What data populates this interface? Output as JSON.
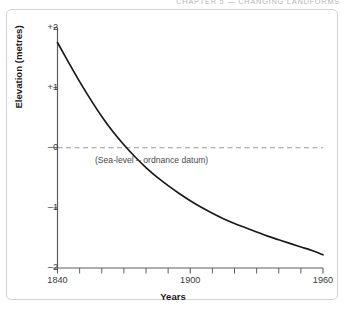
{
  "running_head": {
    "text": "CHAPTER 5  —  CHANGING LANDFORMS"
  },
  "chart_data": {
    "type": "line",
    "title": "",
    "subtitle": "",
    "xlabel": "Years",
    "ylabel": "Elevation (metres)",
    "xlim": [
      1840,
      1960
    ],
    "ylim": [
      -2,
      2
    ],
    "grid": false,
    "legend_position": "none",
    "x_ticks_major": [
      1840,
      1900,
      1960
    ],
    "x_tick_labels": [
      "1840",
      "1900",
      "1960"
    ],
    "x_ticks_minor": [
      1850,
      1860,
      1870,
      1880,
      1890,
      1910,
      1920,
      1930,
      1940,
      1950
    ],
    "y_ticks": [
      2,
      1,
      0,
      -1,
      -2
    ],
    "y_tick_labels": [
      "+2",
      "+1",
      "–0",
      "–1",
      "–2"
    ],
    "annotations": [
      {
        "name": "sea-level-datum-label",
        "text": "(Sea-level – ordnance datum)",
        "x": 1897,
        "y": -0.17
      }
    ],
    "reference_lines": [
      {
        "name": "sea-level-line",
        "orientation": "horizontal",
        "y": 0,
        "style": "dashed",
        "color": "#9a9a9a"
      }
    ],
    "series": [
      {
        "name": "elevation-curve",
        "color": "#1a1a1a",
        "x": [
          1840,
          1845,
          1850,
          1855,
          1860,
          1865,
          1870,
          1875,
          1880,
          1885,
          1890,
          1895,
          1900,
          1905,
          1910,
          1915,
          1920,
          1925,
          1930,
          1935,
          1940,
          1945,
          1950,
          1955,
          1960
        ],
        "values": [
          1.75,
          1.42,
          1.1,
          0.8,
          0.52,
          0.27,
          0.05,
          -0.15,
          -0.33,
          -0.49,
          -0.63,
          -0.76,
          -0.88,
          -0.99,
          -1.09,
          -1.18,
          -1.26,
          -1.33,
          -1.4,
          -1.47,
          -1.53,
          -1.59,
          -1.65,
          -1.71,
          -1.78
        ]
      }
    ]
  },
  "colors": {
    "curve": "#1a1a1a",
    "axis": "#5e5e5e",
    "dashed_reference": "#9a9a9a",
    "frame_border": "#d5d3d1",
    "running_head_text": "#b9b6b4"
  }
}
